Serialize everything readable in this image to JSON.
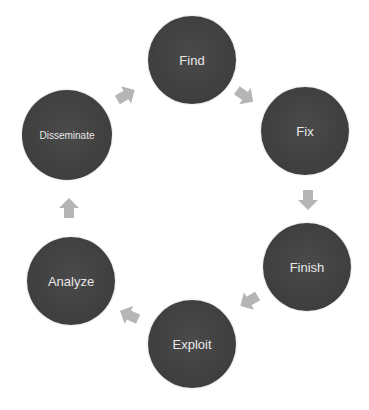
{
  "diagram": {
    "type": "cycle",
    "direction": "clockwise",
    "node_color": "#434343",
    "text_color": "#e8e8e8",
    "arrow_color": "#b5b5b5",
    "nodes": [
      {
        "label": "Find"
      },
      {
        "label": "Fix"
      },
      {
        "label": "Finish"
      },
      {
        "label": "Exploit"
      },
      {
        "label": "Analyze"
      },
      {
        "label": "Disseminate"
      }
    ],
    "edges": [
      {
        "from": "Find",
        "to": "Fix"
      },
      {
        "from": "Fix",
        "to": "Finish"
      },
      {
        "from": "Finish",
        "to": "Exploit"
      },
      {
        "from": "Exploit",
        "to": "Analyze"
      },
      {
        "from": "Analyze",
        "to": "Disseminate"
      },
      {
        "from": "Disseminate",
        "to": "Find"
      }
    ]
  }
}
